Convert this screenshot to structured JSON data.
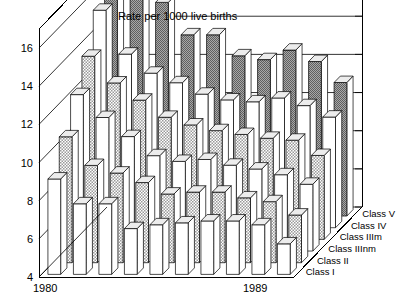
{
  "chart_data": {
    "type": "bar",
    "subtype": "3d-grouped-bar",
    "title": "Rate per 1000 live births",
    "xlabel": "",
    "ylabel": "",
    "zlabel": "",
    "ylim": [
      4,
      17
    ],
    "yticks": [
      4,
      6,
      8,
      10,
      12,
      14,
      16
    ],
    "ytick_labels": [
      "4",
      "6",
      "8",
      "10",
      "12",
      "14",
      "16"
    ],
    "grid": true,
    "legend": "none",
    "x": [
      1980,
      1981,
      1982,
      1983,
      1984,
      1985,
      1986,
      1987,
      1988,
      1989
    ],
    "x_tick_labels_shown": [
      "1980",
      "1989"
    ],
    "categories": [
      "1980",
      "1981",
      "1982",
      "1983",
      "1984",
      "1985",
      "1986",
      "1987",
      "1988",
      "1989"
    ],
    "depth_categories": [
      "Class I",
      "Class II",
      "Class IIInm",
      "Class IIIm",
      "Class IV",
      "Class V"
    ],
    "series": [
      {
        "name": "Class I",
        "fill": "white",
        "values": [
          9.0,
          7.7,
          7.7,
          6.4,
          6.6,
          6.7,
          6.8,
          6.8,
          6.6,
          5.6
        ]
      },
      {
        "name": "Class II",
        "fill": "hatch",
        "values": [
          10.6,
          9.1,
          8.7,
          8.2,
          7.6,
          7.7,
          7.7,
          7.4,
          7.2,
          6.5
        ]
      },
      {
        "name": "Class IIInm",
        "fill": "white",
        "values": [
          12.2,
          11.0,
          10.0,
          9.0,
          8.7,
          8.8,
          8.5,
          8.3,
          8.0,
          7.5
        ]
      },
      {
        "name": "Class IIIm",
        "fill": "hatch",
        "values": [
          13.6,
          12.2,
          11.3,
          10.4,
          10.0,
          9.7,
          9.5,
          9.3,
          9.2,
          8.4
        ]
      },
      {
        "name": "Class IV",
        "fill": "white",
        "values": [
          15.4,
          13.1,
          12.1,
          11.6,
          11.0,
          10.7,
          10.6,
          10.8,
          10.4,
          9.8
        ]
      },
      {
        "name": "Class V",
        "fill": "dark",
        "values": [
          17.1,
          16.6,
          15.2,
          13.5,
          13.5,
          12.4,
          12.2,
          12.7,
          12.1,
          11.0
        ]
      }
    ],
    "colors": {
      "white": "#ffffff",
      "hatch": "#c9c9c9",
      "dark": "#8c8c8c",
      "top_face": "#efefef",
      "side_face": "#ffffff",
      "outline": "#000000",
      "axis": "#000000"
    }
  },
  "axis": {
    "y_ticks": [
      "16",
      "14",
      "12",
      "10",
      "8",
      "6",
      "4"
    ],
    "x_left_label": "1980",
    "x_right_label": "1989"
  },
  "depth_labels": [
    "Class V",
    "Class IV",
    "Class IIIm",
    "Class IIInm",
    "Class II",
    "Class I"
  ],
  "title": "Rate per 1000 live births"
}
